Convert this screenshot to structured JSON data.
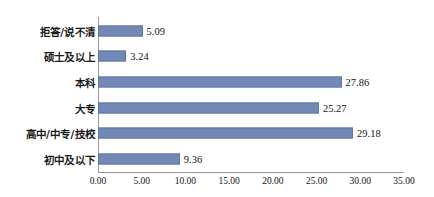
{
  "chart_data": {
    "type": "bar",
    "orientation": "horizontal",
    "title": "",
    "subtitle": "",
    "xlabel": "",
    "ylabel": "",
    "categories": [
      "初中及以下",
      "高中/中专/技校",
      "大专",
      "本科",
      "硕士及以上",
      "拒答/说不清"
    ],
    "values": [
      9.36,
      29.18,
      25.27,
      27.86,
      3.24,
      5.09
    ],
    "value_labels": [
      "9.36",
      "29.18",
      "25.27",
      "27.86",
      "3.24",
      "5.09"
    ],
    "xlim": [
      0,
      35
    ],
    "xticks": [
      0,
      5,
      10,
      15,
      20,
      25,
      30,
      35
    ],
    "xtick_labels": [
      "0.00",
      "5.00",
      "10.00",
      "15.00",
      "20.00",
      "25.00",
      "30.00",
      "35.00"
    ],
    "grid": false,
    "legend": false,
    "legend_position": "none",
    "series": [
      {
        "name": "",
        "values": [
          9.36,
          29.18,
          25.27,
          27.86,
          3.24,
          5.09
        ],
        "color": "#7289b5"
      }
    ],
    "colors": {
      "bar_fill": "#7289b5",
      "bar_border": "#5f78a8",
      "axis_line": "#9a9a9a",
      "text": "#141414",
      "background": "#ffffff"
    }
  }
}
